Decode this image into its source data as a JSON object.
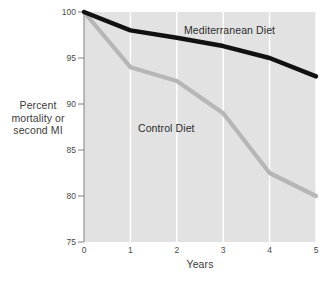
{
  "chart_data": {
    "type": "line",
    "title": "",
    "xlabel": "Years",
    "ylabel": "Percent mortality or second MI",
    "ylabel_lines": [
      "Percent",
      "mortality or",
      "second MI"
    ],
    "x": [
      0,
      1,
      2,
      3,
      4,
      5
    ],
    "xlim": [
      0,
      5
    ],
    "ylim": [
      75,
      100
    ],
    "xticks": [
      "0",
      "1",
      "2",
      "3",
      "4",
      "5"
    ],
    "yticks": [
      "75",
      "80",
      "85",
      "90",
      "95",
      "100"
    ],
    "grid": "vertical-white-gridlines",
    "legend": "inline-labels",
    "plot_background": "#e2e2e2",
    "series": [
      {
        "name": "Mediterranean Diet",
        "color": "#111111",
        "values": [
          100,
          98,
          97.2,
          96.3,
          95,
          93
        ]
      },
      {
        "name": "Control Diet",
        "color": "#b6b6b6",
        "values": [
          100,
          94,
          92.5,
          89,
          82.5,
          80
        ]
      }
    ]
  },
  "labels": {
    "y_title_line1": "Percent",
    "y_title_line2": "mortality or",
    "y_title_line3": "second MI",
    "x_title": "Years",
    "series_mediterranean": "Mediterranean Diet",
    "series_control": "Control Diet"
  },
  "yticks": {
    "t100": "100",
    "t95": "95",
    "t90": "90",
    "t85": "85",
    "t80": "80",
    "t75": "75"
  },
  "xticks": {
    "t0": "0",
    "t1": "1",
    "t2": "2",
    "t3": "3",
    "t4": "4",
    "t5": "5"
  },
  "colors": {
    "mediterranean": "#111111",
    "control": "#b6b6b6",
    "plot_bg": "#e2e2e2",
    "gridline": "#ffffff",
    "axis": "#7a7a7a"
  }
}
